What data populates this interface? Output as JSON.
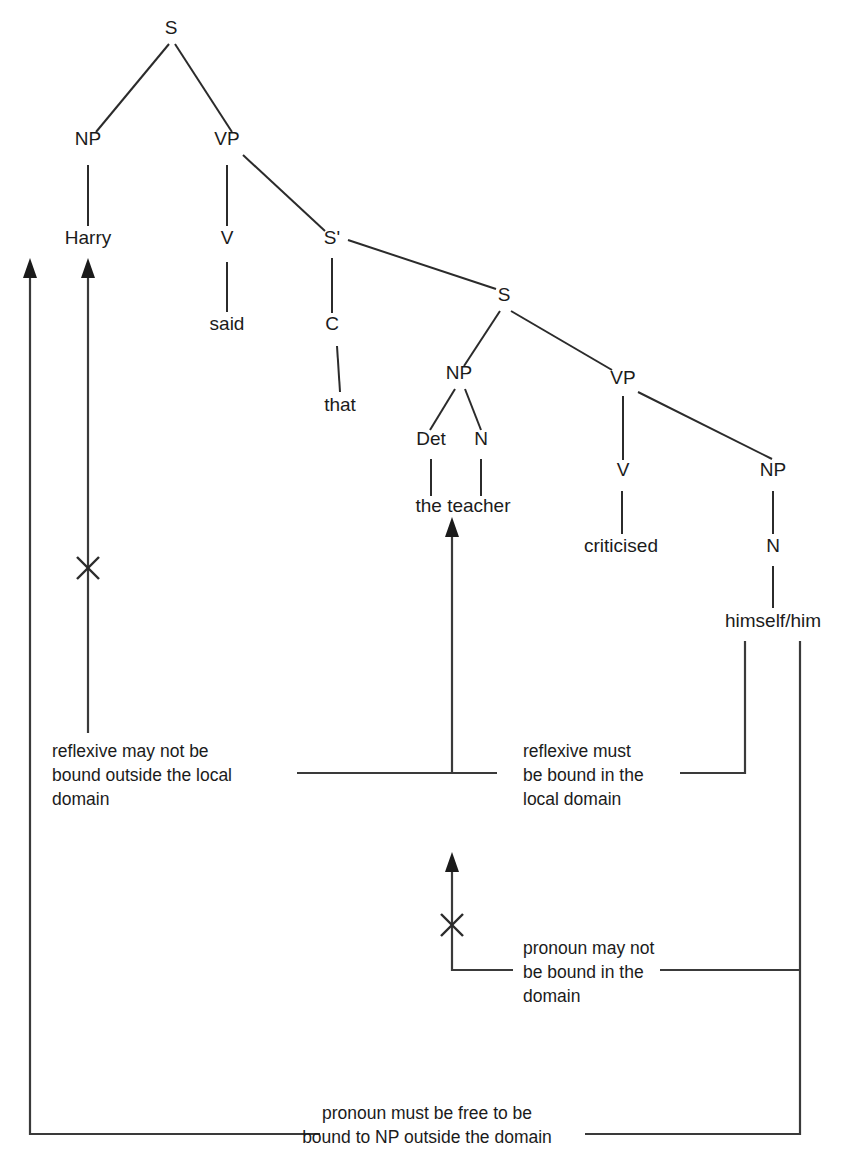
{
  "diagram": {
    "sentence": "Harry said that the teacher criticised himself/him",
    "ink_color": "#1b1b1b",
    "background_color": "#ffffff",
    "tree": {
      "nodes": [
        {
          "id": "s-root",
          "label": "S",
          "x": 171,
          "y": 34,
          "kind": "category"
        },
        {
          "id": "np-matrix",
          "label": "NP",
          "x": 88,
          "y": 145,
          "kind": "category"
        },
        {
          "id": "vp-matrix",
          "label": "VP",
          "x": 227,
          "y": 145,
          "kind": "category"
        },
        {
          "id": "harry",
          "label": "Harry",
          "x": 88,
          "y": 244,
          "kind": "terminal"
        },
        {
          "id": "v-matrix",
          "label": "V",
          "x": 227,
          "y": 244,
          "kind": "category"
        },
        {
          "id": "sbar",
          "label": "S'",
          "x": 332,
          "y": 244,
          "kind": "category"
        },
        {
          "id": "said",
          "label": "said",
          "x": 227,
          "y": 330,
          "kind": "terminal"
        },
        {
          "id": "c-node",
          "label": "C",
          "x": 332,
          "y": 330,
          "kind": "category"
        },
        {
          "id": "s-embedded",
          "label": "S",
          "x": 504,
          "y": 301,
          "kind": "category"
        },
        {
          "id": "that",
          "label": "that",
          "x": 340,
          "y": 411,
          "kind": "terminal"
        },
        {
          "id": "np-embedded",
          "label": "NP",
          "x": 459,
          "y": 379,
          "kind": "category"
        },
        {
          "id": "vp-embedded",
          "label": "VP",
          "x": 623,
          "y": 384,
          "kind": "category"
        },
        {
          "id": "det",
          "label": "Det",
          "x": 431,
          "y": 445,
          "kind": "category"
        },
        {
          "id": "n-teacher",
          "label": "N",
          "x": 481,
          "y": 445,
          "kind": "category"
        },
        {
          "id": "v-embedded",
          "label": "V",
          "x": 623,
          "y": 476,
          "kind": "category"
        },
        {
          "id": "np-object",
          "label": "NP",
          "x": 773,
          "y": 476,
          "kind": "category"
        },
        {
          "id": "the-teacher",
          "label": "the teacher",
          "x": 463,
          "y": 512,
          "kind": "terminal"
        },
        {
          "id": "criticised",
          "label": "criticised",
          "x": 621,
          "y": 552,
          "kind": "terminal"
        },
        {
          "id": "n-object",
          "label": "N",
          "x": 773,
          "y": 552,
          "kind": "category"
        },
        {
          "id": "himself-him",
          "label": "himself/him",
          "x": 773,
          "y": 627,
          "kind": "terminal"
        }
      ],
      "edges": [
        {
          "from": "s-root",
          "to": "np-matrix",
          "type": "branch"
        },
        {
          "from": "s-root",
          "to": "vp-matrix",
          "type": "branch"
        },
        {
          "from": "np-matrix",
          "to": "harry",
          "type": "stem"
        },
        {
          "from": "vp-matrix",
          "to": "v-matrix",
          "type": "stem"
        },
        {
          "from": "vp-matrix",
          "to": "sbar",
          "type": "branch"
        },
        {
          "from": "v-matrix",
          "to": "said",
          "type": "stem"
        },
        {
          "from": "sbar",
          "to": "c-node",
          "type": "stem"
        },
        {
          "from": "sbar",
          "to": "s-embedded",
          "type": "branch"
        },
        {
          "from": "c-node",
          "to": "that",
          "type": "stem"
        },
        {
          "from": "s-embedded",
          "to": "np-embedded",
          "type": "branch"
        },
        {
          "from": "s-embedded",
          "to": "vp-embedded",
          "type": "branch"
        },
        {
          "from": "np-embedded",
          "to": "det",
          "type": "branch"
        },
        {
          "from": "np-embedded",
          "to": "n-teacher",
          "type": "branch"
        },
        {
          "from": "det",
          "to": "the",
          "type": "stem"
        },
        {
          "from": "n-teacher",
          "to": "teacher",
          "type": "stem"
        },
        {
          "from": "vp-embedded",
          "to": "v-embedded",
          "type": "stem"
        },
        {
          "from": "vp-embedded",
          "to": "np-object",
          "type": "branch"
        },
        {
          "from": "v-embedded",
          "to": "criticised",
          "type": "stem"
        },
        {
          "from": "np-object",
          "to": "n-object",
          "type": "stem"
        },
        {
          "from": "n-object",
          "to": "himself-him",
          "type": "stem"
        }
      ]
    },
    "annotations": [
      {
        "id": "reflexive-not-bound-outside",
        "lines": [
          "reflexive may not be",
          "bound outside the local",
          "domain"
        ],
        "x": 52,
        "y": 757,
        "align": "left",
        "has_cross": true,
        "cross_position": {
          "x": 88,
          "y": 568
        },
        "arrow_target": "NP Harry"
      },
      {
        "id": "reflexive-must-be-bound",
        "lines": [
          "reflexive must",
          "be bound in the",
          "local domain"
        ],
        "x": 523,
        "y": 757,
        "align": "left",
        "has_cross": false,
        "arrow_target": "the teacher"
      },
      {
        "id": "pronoun-not-bound-in-domain",
        "lines": [
          "pronoun may not",
          "be bound in the",
          "domain"
        ],
        "x": 523,
        "y": 954,
        "align": "left",
        "has_cross": true,
        "cross_position": {
          "x": 452,
          "y": 925
        },
        "arrow_target": "the teacher"
      },
      {
        "id": "pronoun-must-be-free",
        "lines": [
          "pronoun must be free to be",
          "bound to NP outside the domain"
        ],
        "x": 427,
        "y": 1119,
        "align": "center",
        "has_cross": false,
        "arrow_target": "NP Harry"
      }
    ],
    "arrows": [
      {
        "id": "arrow-to-np-harry-outer",
        "x": 30,
        "head_y": 265,
        "tail_y": 1134,
        "crossed": false
      },
      {
        "id": "arrow-to-np-harry-inner",
        "x": 88,
        "head_y": 265,
        "tail_y": 733,
        "crossed": true
      },
      {
        "id": "arrow-to-the-teacher",
        "x": 452,
        "head_y": 523,
        "tail_y": 774,
        "crossed": false
      },
      {
        "id": "arrow-to-the-teacher-2",
        "x": 452,
        "head_y": 857,
        "tail_y": 970,
        "crossed": true
      }
    ]
  }
}
